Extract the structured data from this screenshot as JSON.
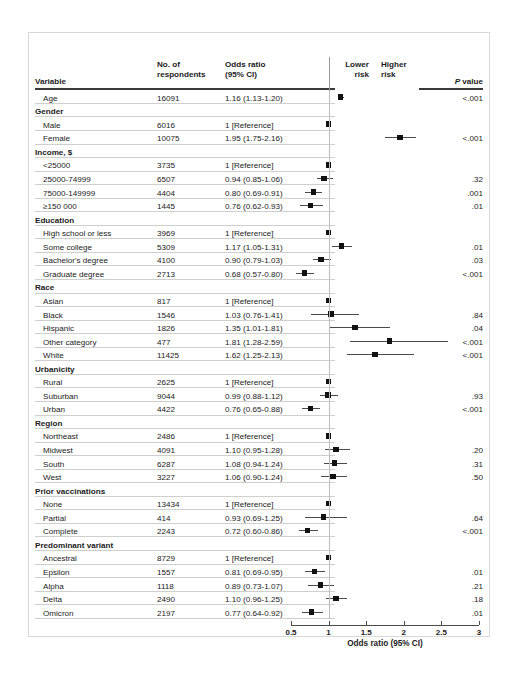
{
  "figure": {
    "axis_title": "Odds ratio (95% CI)",
    "lower_risk_label": "Lower\nrisk",
    "higher_risk_label": "Higher\nrisk",
    "lower_risk_line1": "Lower",
    "lower_risk_line2": "risk",
    "higher_risk_line1": "Higher",
    "higher_risk_line2": "risk"
  },
  "columns": {
    "variable": "Variable",
    "num_line1": "No. of",
    "num_line2": "respondents",
    "or_line1": "Odds ratio",
    "or_line2": "(95% CI)",
    "p_italic": "P",
    "p_rest": " value"
  },
  "chart_data": {
    "type": "forest",
    "title": "",
    "xlabel": "Odds ratio (95% CI)",
    "ylabel": "",
    "xlim": [
      0.5,
      3
    ],
    "xticks": [
      0.5,
      1,
      1.5,
      2,
      2.5,
      3
    ],
    "xtick_labels": [
      "0.5",
      "1",
      "1.5",
      "2",
      "2.5",
      "3"
    ],
    "reference_line": 1,
    "grid": false,
    "legend": "none",
    "rows": [
      {
        "kind": "row",
        "label": "Age",
        "n": "16091",
        "or_text": "1.16 (1.13-1.20)",
        "est": 1.16,
        "lo": 1.13,
        "hi": 1.2,
        "p": "<.001"
      },
      {
        "kind": "group",
        "label": "Gender",
        "n": "",
        "or_text": "",
        "p": ""
      },
      {
        "kind": "row",
        "label": "Male",
        "n": "6016",
        "or_text": "1 [Reference]",
        "est": 1.0,
        "lo": 1.0,
        "hi": 1.0,
        "p": "",
        "reference": true
      },
      {
        "kind": "row",
        "label": "Female",
        "n": "10075",
        "or_text": "1.95 (1.75-2.16)",
        "est": 1.95,
        "lo": 1.75,
        "hi": 2.16,
        "p": "<.001"
      },
      {
        "kind": "group",
        "label": "Income, $",
        "n": "",
        "or_text": "",
        "p": ""
      },
      {
        "kind": "row",
        "label": "<25000",
        "n": "3735",
        "or_text": "1 [Reference]",
        "est": 1.0,
        "lo": 1.0,
        "hi": 1.0,
        "p": "",
        "reference": true
      },
      {
        "kind": "row",
        "label": "25000-74999",
        "n": "6507",
        "or_text": "0.94 (0.85-1.06)",
        "est": 0.94,
        "lo": 0.85,
        "hi": 1.06,
        "p": ".32"
      },
      {
        "kind": "row",
        "label": "75000-149999",
        "n": "4404",
        "or_text": "0.80 (0.69-0.91)",
        "est": 0.8,
        "lo": 0.69,
        "hi": 0.91,
        "p": ".001"
      },
      {
        "kind": "row",
        "label": "≥150 000",
        "n": "1445",
        "or_text": "0.76 (0.62-0.93)",
        "est": 0.76,
        "lo": 0.62,
        "hi": 0.93,
        "p": ".01"
      },
      {
        "kind": "group",
        "label": "Education",
        "n": "",
        "or_text": "",
        "p": ""
      },
      {
        "kind": "row",
        "label": "High school or less",
        "n": "3969",
        "or_text": "1 [Reference]",
        "est": 1.0,
        "lo": 1.0,
        "hi": 1.0,
        "p": "",
        "reference": true
      },
      {
        "kind": "row",
        "label": "Some college",
        "n": "5309",
        "or_text": "1.17 (1.05-1.31)",
        "est": 1.17,
        "lo": 1.05,
        "hi": 1.31,
        "p": ".01"
      },
      {
        "kind": "row",
        "label": "Bachelor's degree",
        "n": "4100",
        "or_text": "0.90 (0.79-1.03)",
        "est": 0.9,
        "lo": 0.79,
        "hi": 1.03,
        "p": ".03"
      },
      {
        "kind": "row",
        "label": "Graduate degree",
        "n": "2713",
        "or_text": "0.68 (0.57-0.80)",
        "est": 0.68,
        "lo": 0.57,
        "hi": 0.8,
        "p": "<.001"
      },
      {
        "kind": "group",
        "label": "Race",
        "n": "",
        "or_text": "",
        "p": ""
      },
      {
        "kind": "row",
        "label": "Asian",
        "n": "817",
        "or_text": "1 [Reference]",
        "est": 1.0,
        "lo": 1.0,
        "hi": 1.0,
        "p": "",
        "reference": true
      },
      {
        "kind": "row",
        "label": "Black",
        "n": "1546",
        "or_text": "1.03 (0.76-1.41)",
        "est": 1.03,
        "lo": 0.76,
        "hi": 1.41,
        "p": ".84"
      },
      {
        "kind": "row",
        "label": "Hispanic",
        "n": "1826",
        "or_text": "1.35 (1.01-1.81)",
        "est": 1.35,
        "lo": 1.01,
        "hi": 1.81,
        "p": ".04"
      },
      {
        "kind": "row",
        "label": "Other category",
        "n": "477",
        "or_text": "1.81 (1.28-2.59)",
        "est": 1.81,
        "lo": 1.28,
        "hi": 2.59,
        "p": "<.001"
      },
      {
        "kind": "row",
        "label": "White",
        "n": "11425",
        "or_text": "1.62 (1.25-2.13)",
        "est": 1.62,
        "lo": 1.25,
        "hi": 2.13,
        "p": "<.001"
      },
      {
        "kind": "group",
        "label": "Urbanicity",
        "n": "",
        "or_text": "",
        "p": ""
      },
      {
        "kind": "row",
        "label": "Rural",
        "n": "2625",
        "or_text": "1 [Reference]",
        "est": 1.0,
        "lo": 1.0,
        "hi": 1.0,
        "p": "",
        "reference": true
      },
      {
        "kind": "row",
        "label": "Suburban",
        "n": "9044",
        "or_text": "0.99 (0.88-1.12)",
        "est": 0.99,
        "lo": 0.88,
        "hi": 1.12,
        "p": ".93"
      },
      {
        "kind": "row",
        "label": "Urban",
        "n": "4422",
        "or_text": "0.76 (0.65-0.88)",
        "est": 0.76,
        "lo": 0.65,
        "hi": 0.88,
        "p": "<.001"
      },
      {
        "kind": "group",
        "label": "Region",
        "n": "",
        "or_text": "",
        "p": ""
      },
      {
        "kind": "row",
        "label": "Northeast",
        "n": "2486",
        "or_text": "1 [Reference]",
        "est": 1.0,
        "lo": 1.0,
        "hi": 1.0,
        "p": "",
        "reference": true
      },
      {
        "kind": "row",
        "label": "Midwest",
        "n": "4091",
        "or_text": "1.10 (0.95-1.28)",
        "est": 1.1,
        "lo": 0.95,
        "hi": 1.28,
        "p": ".20"
      },
      {
        "kind": "row",
        "label": "South",
        "n": "6287",
        "or_text": "1.08 (0.94-1.24)",
        "est": 1.08,
        "lo": 0.94,
        "hi": 1.24,
        "p": ".31"
      },
      {
        "kind": "row",
        "label": "West",
        "n": "3227",
        "or_text": "1.06 (0.90-1.24)",
        "est": 1.06,
        "lo": 0.9,
        "hi": 1.24,
        "p": ".50"
      },
      {
        "kind": "group",
        "label": "Prior vaccinations",
        "n": "",
        "or_text": "",
        "p": ""
      },
      {
        "kind": "row",
        "label": "None",
        "n": "13434",
        "or_text": "1 [Reference]",
        "est": 1.0,
        "lo": 1.0,
        "hi": 1.0,
        "p": "",
        "reference": true
      },
      {
        "kind": "row",
        "label": "Partial",
        "n": "414",
        "or_text": "0.93 (0.69-1.25)",
        "est": 0.93,
        "lo": 0.69,
        "hi": 1.25,
        "p": ".64"
      },
      {
        "kind": "row",
        "label": "Complete",
        "n": "2243",
        "or_text": "0.72 (0.60-0.86)",
        "est": 0.72,
        "lo": 0.6,
        "hi": 0.86,
        "p": "<.001"
      },
      {
        "kind": "group",
        "label": "Predominant variant",
        "n": "",
        "or_text": "",
        "p": ""
      },
      {
        "kind": "row",
        "label": "Ancestral",
        "n": "8729",
        "or_text": "1 [Reference]",
        "est": 1.0,
        "lo": 1.0,
        "hi": 1.0,
        "p": "",
        "reference": true
      },
      {
        "kind": "row",
        "label": "Epsilon",
        "n": "1557",
        "or_text": "0.81 (0.69-0.95)",
        "est": 0.81,
        "lo": 0.69,
        "hi": 0.95,
        "p": ".01"
      },
      {
        "kind": "row",
        "label": "Alpha",
        "n": "1118",
        "or_text": "0.89 (0.73-1.07)",
        "est": 0.89,
        "lo": 0.73,
        "hi": 1.07,
        "p": ".21"
      },
      {
        "kind": "row",
        "label": "Delta",
        "n": "2490",
        "or_text": "1.10 (0.96-1.25)",
        "est": 1.1,
        "lo": 0.96,
        "hi": 1.25,
        "p": ".18"
      },
      {
        "kind": "row",
        "label": "Omicron",
        "n": "2197",
        "or_text": "0.77 (0.64-0.92)",
        "est": 0.77,
        "lo": 0.64,
        "hi": 0.92,
        "p": ".01"
      }
    ]
  }
}
